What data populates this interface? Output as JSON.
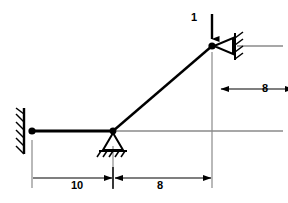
{
  "diagram": {
    "colors": {
      "member": "#000000",
      "dimension": "#000000",
      "extension": "#8a8a8a",
      "background": "#ffffff"
    },
    "labels": {
      "load": "1",
      "span_left": "10",
      "span_right": "8",
      "height": "8"
    },
    "nodes": [
      {
        "name": "left-pin-joint",
        "x": 32,
        "y": 131
      },
      {
        "name": "middle-pin-joint",
        "x": 113,
        "y": 131
      },
      {
        "name": "top-joint",
        "x": 212,
        "y": 46
      }
    ],
    "members": [
      {
        "name": "horizontal-member",
        "from": "left-pin-joint",
        "to": "middle-pin-joint"
      },
      {
        "name": "inclined-member",
        "from": "middle-pin-joint",
        "to": "top-joint"
      }
    ],
    "supports": [
      {
        "name": "left-wall-support",
        "type": "pinned-wall",
        "orientation": "vertical-wall-left"
      },
      {
        "name": "middle-pin-support",
        "type": "pinned-ground",
        "orientation": "ground-below"
      },
      {
        "name": "right-wall-support",
        "type": "pinned-wall",
        "orientation": "vertical-wall-right"
      }
    ],
    "load": {
      "name": "point-load",
      "magnitude": "1",
      "direction": "down",
      "applied_at": "top-joint"
    },
    "dimensions": [
      {
        "name": "horizontal-dimension-left",
        "value": "10",
        "orientation": "horizontal"
      },
      {
        "name": "horizontal-dimension-right",
        "value": "8",
        "orientation": "horizontal"
      },
      {
        "name": "vertical-dimension",
        "value": "8",
        "orientation": "vertical"
      }
    ]
  }
}
